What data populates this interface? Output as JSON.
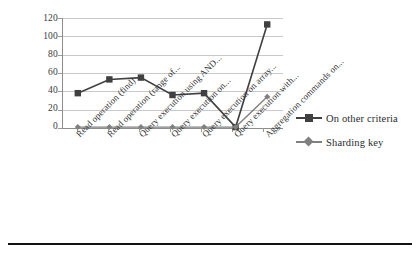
{
  "chart_data": {
    "type": "line",
    "title": "",
    "xlabel": "",
    "ylabel": "",
    "ylim": [
      0,
      120
    ],
    "yticks": [
      0,
      20,
      40,
      60,
      80,
      100,
      120
    ],
    "grid": true,
    "legend_position": "right",
    "categories": [
      "Read operation (find)",
      "Read operation (range of...",
      "Query execution using AND...",
      "Query execution on...",
      "Query execution on array...",
      "Query execution with...",
      "Aggregation commands on..."
    ],
    "series": [
      {
        "name": "On other criteria",
        "color": "#404040",
        "marker": "square",
        "values": [
          38,
          53,
          55,
          36,
          38,
          1,
          113
        ]
      },
      {
        "name": "Sharding key",
        "color": "#808080",
        "marker": "diamond",
        "values": [
          1,
          1,
          1,
          1,
          1,
          1,
          34
        ]
      }
    ]
  },
  "axis": {
    "ytick_labels": [
      "120",
      "100",
      "80",
      "60",
      "40",
      "20",
      "0"
    ]
  },
  "legend": {
    "items": [
      {
        "label": "On other criteria"
      },
      {
        "label": "Sharding key"
      }
    ]
  },
  "colors": {
    "series_on_other_criteria": "#404040",
    "series_sharding_key": "#808080",
    "gridline": "#c9c9c9",
    "axis": "#8d8d8d",
    "rule": "#111111"
  }
}
